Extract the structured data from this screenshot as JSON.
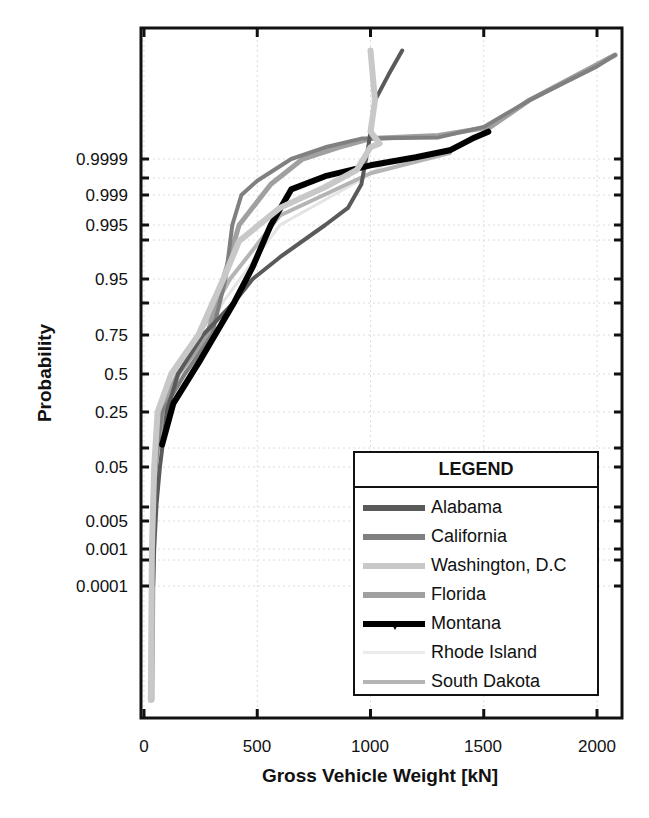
{
  "chart_data": {
    "type": "line",
    "title": "",
    "xlabel": "Gross Vehicle Weight [kN]",
    "ylabel": "Probability",
    "xlim": [
      0,
      2100
    ],
    "x_ticks": [
      0,
      500,
      1000,
      1500,
      2000
    ],
    "x_tick_labels": [
      "0",
      "500",
      "1000",
      "1500",
      "2000"
    ],
    "y_scale": "normal-probability",
    "y_ticks": [
      0.9999,
      0.999,
      0.995,
      0.95,
      0.75,
      0.5,
      0.25,
      0.05,
      0.005,
      0.001,
      0.0001
    ],
    "y_tick_labels": [
      "0.9999",
      "0.999",
      "0.995",
      "0.95",
      "0.75",
      "0.5",
      "0.25",
      "0.05",
      "0.005",
      "0.001",
      "0.0001"
    ],
    "grid": true,
    "legend_position": "lower right",
    "legend_title": "LEGEND",
    "series": [
      {
        "name": "Alabama",
        "color": "#5a5a5a",
        "width": 4,
        "points": [
          [
            40,
            0.0001
          ],
          [
            45,
            0.001
          ],
          [
            55,
            0.01
          ],
          [
            70,
            0.05
          ],
          [
            100,
            0.25
          ],
          [
            150,
            0.5
          ],
          [
            260,
            0.75
          ],
          [
            400,
            0.9
          ],
          [
            480,
            0.95
          ],
          [
            600,
            0.98
          ],
          [
            800,
            0.995
          ],
          [
            900,
            0.998
          ],
          [
            960,
            0.9995
          ],
          [
            990,
            0.99995
          ],
          [
            1020,
            0.999995
          ],
          [
            1080,
            0.999998
          ],
          [
            1140,
            0.9999995
          ]
        ]
      },
      {
        "name": "California",
        "color": "#808080",
        "width": 4,
        "points": [
          [
            30,
            1e-07
          ],
          [
            40,
            0.001
          ],
          [
            50,
            0.05
          ],
          [
            80,
            0.25
          ],
          [
            180,
            0.5
          ],
          [
            300,
            0.75
          ],
          [
            360,
            0.95
          ],
          [
            390,
            0.995
          ],
          [
            430,
            0.999
          ],
          [
            500,
            0.9996
          ],
          [
            650,
            0.9999
          ],
          [
            800,
            0.99995
          ],
          [
            960,
            0.99997
          ],
          [
            1300,
            0.999972
          ],
          [
            1500,
            0.999985
          ],
          [
            1700,
            0.999995
          ],
          [
            2000,
            0.9999985
          ],
          [
            2080,
            0.999999
          ]
        ]
      },
      {
        "name": "Washington, D.C",
        "color": "#c8c8c8",
        "width": 6,
        "points": [
          [
            30,
            1e-07
          ],
          [
            35,
            0.001
          ],
          [
            45,
            0.05
          ],
          [
            60,
            0.25
          ],
          [
            120,
            0.5
          ],
          [
            240,
            0.75
          ],
          [
            350,
            0.95
          ],
          [
            420,
            0.99
          ],
          [
            600,
            0.998
          ],
          [
            800,
            0.9994
          ],
          [
            940,
            0.9998
          ],
          [
            1000,
            0.99995
          ],
          [
            1040,
            0.99996
          ],
          [
            1000,
            0.99998
          ],
          [
            1020,
            0.999995
          ],
          [
            1000,
            0.9999995
          ]
        ]
      },
      {
        "name": "Florida",
        "color": "#a0a0a0",
        "width": 5,
        "points": [
          [
            35,
            1e-07
          ],
          [
            40,
            0.001
          ],
          [
            50,
            0.05
          ],
          [
            70,
            0.25
          ],
          [
            150,
            0.5
          ],
          [
            280,
            0.75
          ],
          [
            350,
            0.95
          ],
          [
            420,
            0.995
          ],
          [
            560,
            0.9995
          ],
          [
            700,
            0.9999
          ],
          [
            860,
            0.99995
          ],
          [
            1000,
            0.99997
          ],
          [
            1300,
            0.999975
          ],
          [
            1530,
            0.999985
          ],
          [
            1700,
            0.999995
          ],
          [
            2080,
            0.999999
          ]
        ]
      },
      {
        "name": "Montana",
        "color": "#000000",
        "width": 6,
        "points": [
          [
            80,
            0.1
          ],
          [
            130,
            0.3
          ],
          [
            250,
            0.6
          ],
          [
            400,
            0.9
          ],
          [
            480,
            0.97
          ],
          [
            560,
            0.995
          ],
          [
            650,
            0.9993
          ],
          [
            800,
            0.9997
          ],
          [
            1000,
            0.99985
          ],
          [
            1200,
            0.99991
          ],
          [
            1350,
            0.99994
          ],
          [
            1450,
            0.99997
          ],
          [
            1520,
            0.99998
          ]
        ]
      },
      {
        "name": "Rhode Island",
        "color": "#ebebeb",
        "width": 3,
        "points": [
          [
            40,
            0.0001
          ],
          [
            50,
            0.05
          ],
          [
            80,
            0.25
          ],
          [
            200,
            0.6
          ],
          [
            350,
            0.9
          ],
          [
            600,
            0.995
          ],
          [
            950,
            0.9996
          ],
          [
            1100,
            0.9999
          ]
        ]
      },
      {
        "name": "South Dakota",
        "color": "#b4b4b4",
        "width": 4,
        "points": [
          [
            40,
            0.0001
          ],
          [
            50,
            0.05
          ],
          [
            90,
            0.3
          ],
          [
            220,
            0.7
          ],
          [
            380,
            0.95
          ],
          [
            600,
            0.997
          ],
          [
            1000,
            0.99975
          ],
          [
            1350,
            0.99993
          ]
        ]
      }
    ]
  },
  "axes": {
    "x_title": "Gross Vehicle Weight [kN]",
    "y_title": "Probability",
    "x_labels": [
      "0",
      "500",
      "1000",
      "1500",
      "2000"
    ],
    "y_labels": [
      "0.9999",
      "0.999",
      "0.995",
      "0.95",
      "0.75",
      "0.5",
      "0.25",
      "0.05",
      "0.005",
      "0.001",
      "0.0001"
    ]
  },
  "legend": {
    "title": "LEGEND",
    "items": [
      {
        "label": "Alabama",
        "color": "#5a5a5a"
      },
      {
        "label": "California",
        "color": "#808080"
      },
      {
        "label": "Washington, D.C",
        "color": "#c8c8c8"
      },
      {
        "label": "Florida",
        "color": "#a0a0a0"
      },
      {
        "label": "Montana",
        "color": "#000000"
      },
      {
        "label": "Rhode Island",
        "color": "#ebebeb"
      },
      {
        "label": "South Dakota",
        "color": "#b4b4b4"
      }
    ]
  }
}
